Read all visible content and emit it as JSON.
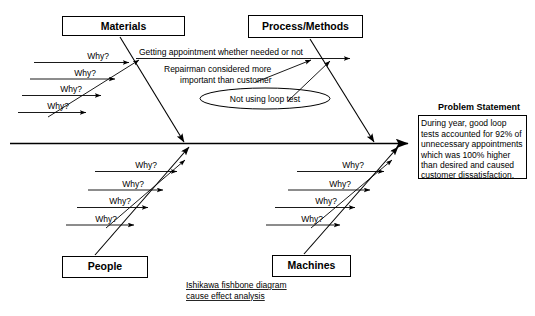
{
  "diagram": {
    "kind": "ishikawa-fishbone",
    "caption": {
      "line1": "Ishikawa fishbone diagram",
      "line2": "cause effect analysis"
    },
    "why_label": "Why?",
    "categories": [
      {
        "id": "materials",
        "label": "Materials",
        "position": "top-left",
        "why_count": 4
      },
      {
        "id": "process-methods",
        "label": "Process/Methods",
        "position": "top-right",
        "why_count": 0
      },
      {
        "id": "people",
        "label": "People",
        "position": "bottom-left",
        "why_count": 4
      },
      {
        "id": "machines",
        "label": "Machines",
        "position": "bottom-right",
        "why_count": 4
      }
    ],
    "process_causes": [
      {
        "id": "cause-appointment",
        "text": "Getting appointment whether needed or not"
      },
      {
        "id": "cause-repairman-1",
        "text": "Repairman considered more"
      },
      {
        "id": "cause-repairman-2",
        "text": "important than customer"
      },
      {
        "id": "cause-loop-test",
        "text": "Not using loop test",
        "shape": "ellipse"
      }
    ],
    "problem_statement": {
      "title": "Problem Statement",
      "lines": [
        "During year, good loop",
        "tests accounted for 92% of",
        "unnecessary appointments",
        "which was 100% higher",
        "than desired and caused",
        "customer dissatisfaction."
      ]
    },
    "colors": {
      "ink": "#000000",
      "paper": "#ffffff"
    }
  }
}
